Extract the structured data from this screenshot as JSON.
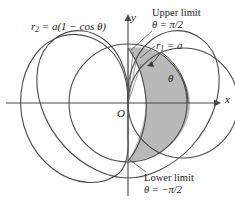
{
  "figure": {
    "type": "polar-area-diagram",
    "background": "#ffffff",
    "stroke_color": "#4a4a4a",
    "shade_color": "#b9b9b9",
    "text_color": "#1a1a1a",
    "width": 235,
    "height": 204
  },
  "axes": {
    "x_label": "x",
    "y_label": "y",
    "origin_label": "O",
    "origin_px": {
      "x": 128,
      "y": 103
    },
    "x_axis_from_px": 6,
    "x_axis_to_px": 218,
    "y_axis_from_px": 196,
    "y_axis_to_px": 17
  },
  "curves": [
    {
      "name": "circle-r1",
      "equation_r": "r_1 = a",
      "label": "r",
      "label_sub": "1",
      "label_rest": " = a",
      "type": "circle",
      "polar": "r = a",
      "a": 1,
      "center_px": {
        "x": 183,
        "y": 103
      },
      "radius_px": 55
    },
    {
      "name": "cardioid-r2",
      "equation_r": "r_2 = a(1 - cos θ)",
      "label": "r",
      "label_sub": "2",
      "label_rest": " = a(1 − cos θ)",
      "type": "cardioid",
      "polar": "r = a(1 - cos θ)",
      "a": 1,
      "cusp_px": {
        "x": 128,
        "y": 103
      },
      "leftmost_px": {
        "x": 21,
        "y": 103
      }
    }
  ],
  "annotations": {
    "upper_limit": {
      "line1": "Upper limit",
      "line2": "θ = π/2",
      "points_to_px": {
        "x": 129,
        "y": 48
      }
    },
    "lower_limit": {
      "line1": "Lower limit",
      "line2": "θ = −π/2",
      "points_to_px": {
        "x": 129,
        "y": 161
      }
    },
    "theta_arc": {
      "label": "θ",
      "description": "angle arc from x-axis to radial ray"
    }
  },
  "shaded_region": {
    "description": "region between circle r = a and cardioid r = a(1 - cos θ) for θ from -π/2 to π/2",
    "fill": "#b9b9b9"
  },
  "intersections": [
    {
      "label": "upper",
      "px": {
        "x": 128,
        "y": 48
      }
    },
    {
      "label": "lower",
      "px": {
        "x": 128,
        "y": 161
      }
    }
  ]
}
